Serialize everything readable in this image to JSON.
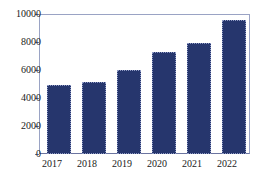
{
  "chart_data": {
    "type": "bar",
    "title": "",
    "subtitle": "",
    "xlabel": "",
    "ylabel": "",
    "categories": [
      "2017",
      "2018",
      "2019",
      "2020",
      "2021",
      "2022"
    ],
    "values": [
      4900,
      5150,
      6000,
      7300,
      7950,
      9550
    ],
    "series": [
      {
        "name": "",
        "values": [
          4900,
          5150,
          6000,
          7300,
          7950,
          9550
        ]
      }
    ],
    "ylim": [
      0,
      10000
    ],
    "yticks": [
      0,
      2000,
      4000,
      6000,
      8000,
      10000
    ],
    "ytick_labels": [
      "0",
      "2000",
      "4000",
      "6000",
      "8000",
      "10000"
    ],
    "xtick_labels": [
      "2017",
      "2018",
      "2019",
      "2020",
      "2021",
      "2022"
    ],
    "grid": false,
    "legend": null,
    "legend_position": "none",
    "annotations": [],
    "colors": {
      "bar_fill": "#26366d",
      "bar_edge": "#8f9ac4",
      "axis": "#6b74a0",
      "frame": "#9aa3c4",
      "text": "#1a1a1a",
      "background": "#ffffff"
    }
  }
}
